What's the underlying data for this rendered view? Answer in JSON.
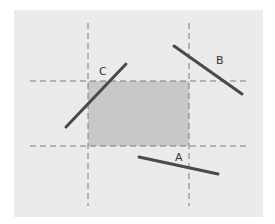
{
  "diagram": {
    "background_color": "#ffffff",
    "panel": {
      "x": 14,
      "y": 10,
      "width": 249,
      "height": 207,
      "color": "#ebebeb"
    },
    "shaded_region": {
      "x": 88,
      "y": 81,
      "width": 101,
      "height": 65,
      "color": "#c8c8c8"
    },
    "guide_lines": {
      "color": "#7a7a7a",
      "dash": "6,4",
      "vertical": [
        {
          "x": 88,
          "y1": 23,
          "y2": 206
        },
        {
          "x": 189,
          "y1": 23,
          "y2": 206
        }
      ],
      "horizontal": [
        {
          "y": 81,
          "x1": 30,
          "x2": 247
        },
        {
          "y": 146,
          "x1": 30,
          "x2": 247
        }
      ]
    },
    "segments": [
      {
        "name": "A",
        "label": "A",
        "x1": 139,
        "y1": 157,
        "x2": 218,
        "y2": 174,
        "label_x": 175,
        "label_y": 161
      },
      {
        "name": "B",
        "label": "B",
        "x1": 174,
        "y1": 46,
        "x2": 242,
        "y2": 94,
        "label_x": 216,
        "label_y": 64
      },
      {
        "name": "C",
        "label": "C",
        "x1": 66,
        "y1": 127,
        "x2": 126,
        "y2": 64,
        "label_x": 99,
        "label_y": 75
      }
    ],
    "segment_color": "#4a4a4a",
    "segment_width": 3
  }
}
